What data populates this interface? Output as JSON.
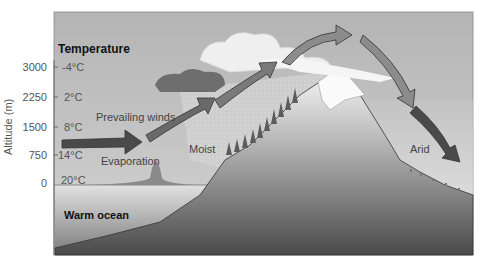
{
  "diagram": {
    "title": "Temperature",
    "y_axis_label": "Altitude (m)",
    "altitude_ticks": [
      "3000",
      "2250",
      "1500",
      "750",
      "0"
    ],
    "temperatures": [
      "-4°C",
      "2°C",
      "8°C",
      "14°C",
      "20°C"
    ],
    "labels": {
      "prevailing_winds": "Prevailing winds",
      "evaporation": "Evaporation",
      "moist": "Moist",
      "arid": "Arid",
      "warm_ocean": "Warm ocean"
    },
    "colors": {
      "sky": "#b9b9b9",
      "ocean_top": "#d8d8d8",
      "ocean_bottom": "#777777",
      "mountain_top": "#f2f2f2",
      "mountain_bottom": "#4a4a4a",
      "arrow_dark": "#4f4f4f",
      "arrow_light": "#8c8c8c"
    }
  }
}
